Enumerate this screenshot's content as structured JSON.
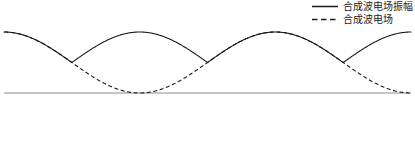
{
  "figure": {
    "background_color": "#ffffff",
    "width": 415,
    "height": 150
  },
  "legend": {
    "position": "top-right",
    "items": [
      {
        "label": "合成波电场振幅",
        "style": "solid",
        "color": "#1a1a1a",
        "swatch_name": "legend-swatch-solid"
      },
      {
        "label": "合成波电场",
        "style": "dashed",
        "color": "#1a1a1a",
        "swatch_name": "legend-swatch-dashed"
      }
    ]
  },
  "axis": {
    "baseline_color": "#8c8c8c",
    "baseline_y": 93,
    "x_start": 4,
    "x_end": 411,
    "show_ticks": false,
    "show_labels": false
  },
  "chart_data": {
    "type": "line",
    "title": "",
    "subtitle": "",
    "xlabel": "",
    "ylabel": "",
    "grid": false,
    "legend_position": "top-right",
    "xlim": [
      0,
      1
    ],
    "ylim": [
      -1.15,
      1.15
    ],
    "parameters": {
      "envelope_cycles": 3,
      "envelope_humps": 6,
      "carrier_cycles": 3,
      "envelope_amplitude": 1.0,
      "carrier_amplitude": 1.0,
      "envelope_formula": "A(x) = |cos(3*pi*x)| scaled to top region",
      "field_formula": "E(x) = A(x) * cos(3*pi*x)"
    },
    "series": [
      {
        "name": "合成波电场振幅",
        "style": "solid",
        "color": "#1a1a1a",
        "x": [
          0.0,
          0.0417,
          0.0833,
          0.125,
          0.1667,
          0.2083,
          0.25,
          0.2917,
          0.3333,
          0.375,
          0.4167,
          0.4583,
          0.5,
          0.5417,
          0.5833,
          0.625,
          0.6667,
          0.7083,
          0.75,
          0.7917,
          0.8333,
          0.875,
          0.9167,
          0.9583,
          1.0
        ],
        "values": [
          0.0,
          0.38,
          0.71,
          0.92,
          1.0,
          0.92,
          0.71,
          0.38,
          0.0,
          0.38,
          0.71,
          0.92,
          1.0,
          0.92,
          0.71,
          0.38,
          0.0,
          0.38,
          0.71,
          0.92,
          1.0,
          0.92,
          0.71,
          0.38,
          0.0
        ]
      },
      {
        "name": "合成波电场",
        "style": "dashed",
        "color": "#1a1a1a",
        "x": [
          0.0,
          0.0417,
          0.0833,
          0.125,
          0.1667,
          0.2083,
          0.25,
          0.2917,
          0.3333,
          0.375,
          0.4167,
          0.4583,
          0.5,
          0.5417,
          0.5833,
          0.625,
          0.6667,
          0.7083,
          0.75,
          0.7917,
          0.8333,
          0.875,
          0.9167,
          0.9583,
          1.0
        ],
        "values": [
          0.0,
          -0.38,
          -0.71,
          -0.92,
          -1.0,
          -0.92,
          -0.71,
          -0.38,
          0.0,
          0.38,
          0.71,
          0.92,
          1.0,
          0.92,
          0.71,
          0.38,
          0.0,
          -0.38,
          -0.71,
          -0.92,
          -1.0,
          -0.92,
          -0.71,
          -0.38,
          0.0
        ]
      }
    ]
  }
}
